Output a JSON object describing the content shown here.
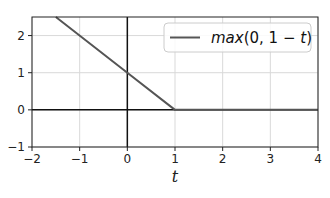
{
  "chart_data": {
    "type": "line",
    "title": "",
    "xlabel": "t",
    "ylabel": "",
    "xlim": [
      -2,
      4
    ],
    "ylim": [
      -1,
      2.5
    ],
    "xticks": [
      -2,
      -1,
      0,
      1,
      2,
      3,
      4
    ],
    "yticks": [
      -1,
      0,
      1,
      2
    ],
    "xtick_labels": [
      "−2",
      "−1",
      "0",
      "1",
      "2",
      "3",
      "4"
    ],
    "ytick_labels": [
      "−1",
      "0",
      "1",
      "2"
    ],
    "grid": true,
    "legend_position": "upper right",
    "axes_lines": {
      "x0": true,
      "y0": true
    },
    "series": [
      {
        "name": "max(0, 1 − t)",
        "color": "#555555",
        "x": [
          -1.5,
          0,
          1,
          2,
          3,
          4
        ],
        "y": [
          2.5,
          1,
          0,
          0,
          0,
          0
        ]
      }
    ]
  },
  "legend": {
    "label": "max(0, 1 − t)",
    "label_func": "max",
    "label_args": "(0, 1 − ",
    "label_var": "t",
    "label_close": ")"
  },
  "axes": {
    "xlabel": "t"
  },
  "colors": {
    "series": "#555555",
    "axes": "#000000",
    "grid": "#d9d9d9"
  }
}
